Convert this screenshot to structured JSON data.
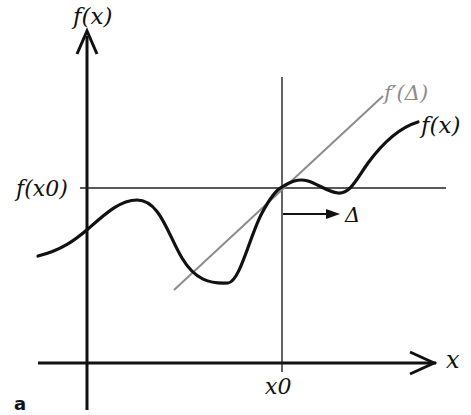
{
  "diagram": {
    "panel_label": "a",
    "y_axis_label": "f(x)",
    "x_axis_label": "x",
    "x0_label": "x0",
    "fx0_label": "f(x0)",
    "curve_label": "f(x)",
    "tangent_label": "f′(Δ)",
    "delta_label": "Δ",
    "colors": {
      "curve": "#111111",
      "axes": "#111111",
      "tangent": "#8c8c8c",
      "guide_lines": "#222222"
    }
  }
}
